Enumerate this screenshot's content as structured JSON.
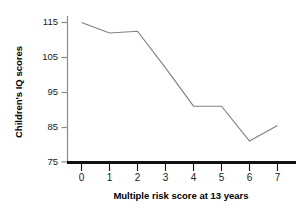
{
  "chart_data": {
    "type": "line",
    "title": "",
    "subtitle": "",
    "xlabel": "Multiple risk score at 13 years",
    "ylabel": "Children's IQ scores",
    "x": [
      0,
      1,
      2,
      3,
      4,
      5,
      6,
      7
    ],
    "values": [
      115,
      112,
      112.5,
      102,
      91,
      91,
      81,
      85.5
    ],
    "categories": [
      "0",
      "1",
      "2",
      "3",
      "4",
      "5",
      "6",
      "7"
    ],
    "xtick_labels": [
      "0",
      "1",
      "2",
      "3",
      "4",
      "5",
      "6",
      "7"
    ],
    "ytick_labels": [
      "75",
      "85",
      "95",
      "105",
      "115"
    ],
    "ytick_values": [
      75,
      85,
      95,
      105,
      115
    ],
    "xlim": [
      -0.45,
      7.55
    ],
    "ylim": [
      75,
      117
    ],
    "grid": false,
    "legend": false,
    "legend_position": "none",
    "line_color": "#808080",
    "axis_color": "#000000",
    "background_color": "#ffffff",
    "markers": false,
    "annotations": []
  },
  "colors": {
    "line": "#808080",
    "x_axis": "#111111",
    "y_axis": "#8a8a8a",
    "tick_text": "#1a1a1a",
    "title_text": "#000000",
    "background": "#ffffff"
  }
}
